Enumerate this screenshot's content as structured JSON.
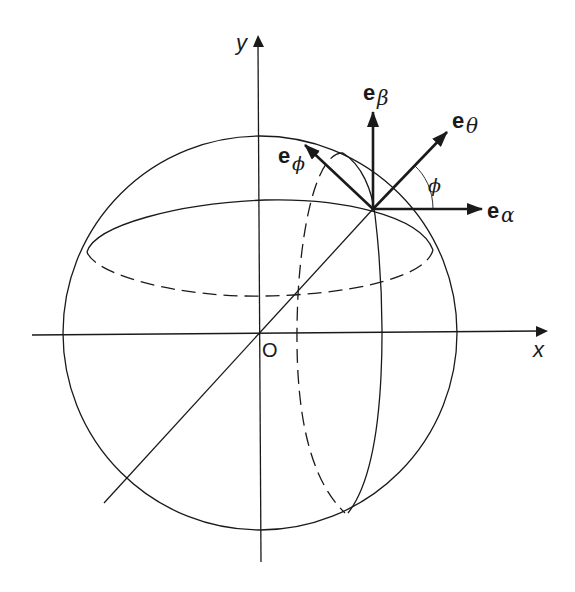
{
  "figure": {
    "axes": {
      "x_label": "x",
      "y_label": "y",
      "origin_label": "O"
    },
    "vectors": [
      {
        "id": "e_beta",
        "base": "e",
        "subscript": "β"
      },
      {
        "id": "e_theta",
        "base": "e",
        "subscript": "θ"
      },
      {
        "id": "e_phi",
        "base": "e",
        "subscript": "ϕ"
      },
      {
        "id": "e_alpha",
        "base": "e",
        "subscript": "α"
      }
    ],
    "angle_label": "ϕ",
    "colors": {
      "stroke": "#1a1a1a",
      "background": "#ffffff"
    }
  }
}
